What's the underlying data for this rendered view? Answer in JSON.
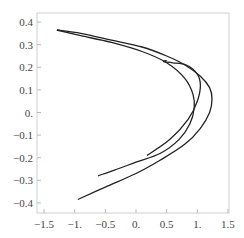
{
  "chart_data": {
    "type": "line",
    "title": "",
    "xlabel": "",
    "ylabel": "",
    "xlim": [
      -1.6,
      1.55
    ],
    "ylim": [
      -0.44,
      0.44
    ],
    "grid": false,
    "legend": null,
    "x_ticks": [
      -1.5,
      -1.0,
      -0.5,
      0.0,
      0.5,
      1.0,
      1.5
    ],
    "x_tick_labels": [
      "−1.5",
      "−1.",
      "−0.5",
      "0.",
      "0.5",
      "1.",
      "1.5"
    ],
    "y_ticks": [
      0.4,
      0.3,
      0.2,
      0.1,
      0.0,
      -0.1,
      -0.2,
      -0.3,
      -0.4
    ],
    "y_tick_labels": [
      "0.4",
      "0.3",
      "0.2",
      "0.1",
      "0.",
      "−0.1",
      "−0.2",
      "−0.3",
      "−0.4"
    ],
    "line_color": "#222222",
    "series": [
      {
        "name": "outer-branch",
        "x": [
          -0.95,
          -0.5,
          0.0,
          0.4,
          0.8,
          1.05,
          1.2,
          1.24,
          1.2,
          1.05,
          0.8,
          0.5,
          0.1,
          -0.4,
          -0.9,
          -1.29
        ],
        "y": [
          -0.385,
          -0.33,
          -0.27,
          -0.21,
          -0.14,
          -0.07,
          0.0,
          0.06,
          0.11,
          0.16,
          0.21,
          0.25,
          0.29,
          0.32,
          0.35,
          0.365
        ]
      },
      {
        "name": "inner-branch",
        "x": [
          -1.29,
          -0.9,
          -0.4,
          0.1,
          0.5,
          0.8,
          0.93,
          0.95,
          0.88,
          0.7,
          0.4,
          0.0,
          -0.35,
          -0.62
        ],
        "y": [
          0.365,
          0.34,
          0.31,
          0.27,
          0.22,
          0.15,
          0.08,
          0.02,
          -0.05,
          -0.12,
          -0.18,
          -0.22,
          -0.255,
          -0.28
        ]
      },
      {
        "name": "hook-branch",
        "x": [
          0.18,
          0.55,
          0.85,
          1.0,
          1.05,
          1.0,
          0.82,
          0.6,
          0.45,
          0.5
        ],
        "y": [
          -0.19,
          -0.12,
          -0.03,
          0.05,
          0.12,
          0.17,
          0.21,
          0.22,
          0.225,
          0.23
        ]
      }
    ]
  }
}
